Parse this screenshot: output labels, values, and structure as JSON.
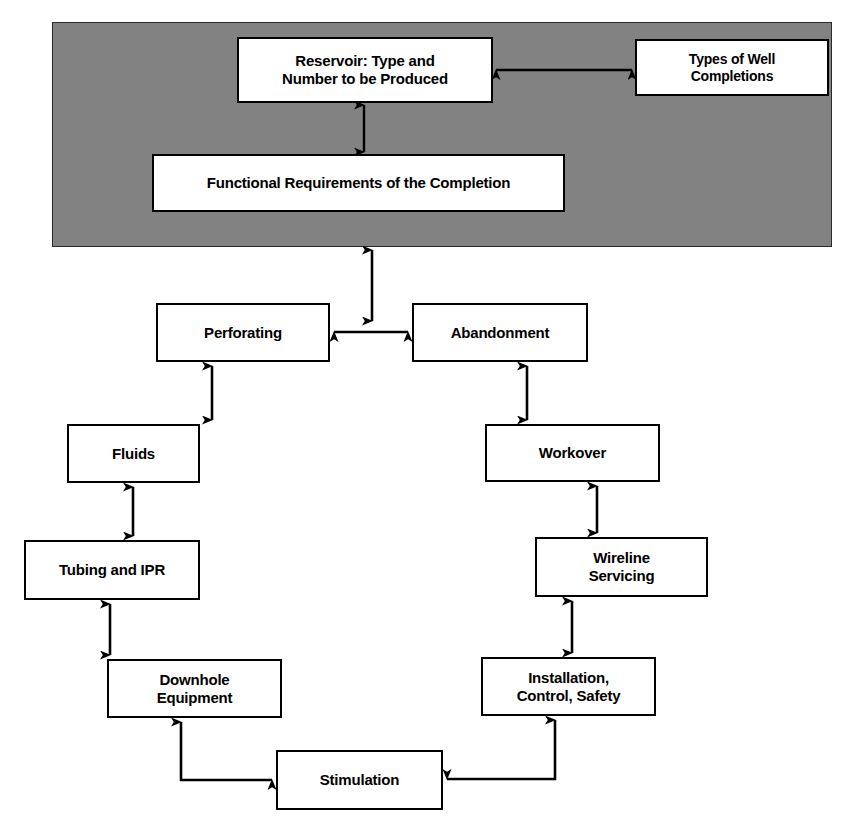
{
  "diagram": {
    "title_present": false,
    "background_color": "#ffffff",
    "panel_color": "#828282",
    "box_fill": "#ffffff",
    "line_color": "#000000",
    "panel": {
      "name": "completion-design-panel",
      "x": 52,
      "y": 22,
      "w": 780,
      "h": 225
    },
    "nodes": [
      {
        "id": "reservoir",
        "label": "Reservoir:  Type and\nNumber to be Produced",
        "x": 238,
        "y": 38,
        "w": 254,
        "h": 64,
        "font_size": 15,
        "in_panel": true
      },
      {
        "id": "well-completions",
        "label": "Types of Well\nCompletions",
        "x": 636,
        "y": 40,
        "w": 192,
        "h": 55,
        "font_size": 14,
        "in_panel": true
      },
      {
        "id": "functional-requirements",
        "label": "Functional Requirements of the Completion",
        "x": 153,
        "y": 155,
        "w": 411,
        "h": 56,
        "font_size": 15,
        "in_panel": true
      },
      {
        "id": "perforating",
        "label": "Perforating",
        "x": 156,
        "y": 303,
        "w": 174,
        "h": 59,
        "font_size": 15,
        "in_panel": false
      },
      {
        "id": "abandonment",
        "label": "Abandonment",
        "x": 412,
        "y": 303,
        "w": 176,
        "h": 59,
        "font_size": 15,
        "in_panel": false
      },
      {
        "id": "fluids",
        "label": "Fluids",
        "x": 67,
        "y": 424,
        "w": 133,
        "h": 59,
        "font_size": 15,
        "in_panel": false
      },
      {
        "id": "workover",
        "label": "Workover",
        "x": 485,
        "y": 424,
        "w": 175,
        "h": 58,
        "font_size": 15,
        "in_panel": false
      },
      {
        "id": "tubing-and-ipr",
        "label": "Tubing and IPR",
        "x": 24,
        "y": 540,
        "w": 176,
        "h": 60,
        "font_size": 15,
        "in_panel": false
      },
      {
        "id": "wireline-servicing",
        "label": "Wireline\nServicing",
        "x": 535,
        "y": 537,
        "w": 173,
        "h": 60,
        "font_size": 15,
        "in_panel": false
      },
      {
        "id": "downhole-equipment",
        "label": "Downhole\nEquipment",
        "x": 107,
        "y": 659,
        "w": 175,
        "h": 59,
        "font_size": 15,
        "in_panel": false
      },
      {
        "id": "installation-control-safety",
        "label": "Installation,\nControl, Safety",
        "x": 481,
        "y": 657,
        "w": 175,
        "h": 59,
        "font_size": 15,
        "in_panel": false
      },
      {
        "id": "stimulation",
        "label": "Stimulation",
        "x": 276,
        "y": 750,
        "w": 167,
        "h": 60,
        "font_size": 15,
        "in_panel": false
      }
    ],
    "connectors": [
      {
        "id": "reservoir-to-well-completions",
        "from": "reservoir",
        "to": "well-completions",
        "kind": "double-arrow",
        "orientation": "horizontal"
      },
      {
        "id": "reservoir-to-functional-requirements",
        "from": "reservoir",
        "to": "functional-requirements",
        "kind": "double-arrow",
        "orientation": "vertical"
      },
      {
        "id": "panel-to-perforating-abandonment",
        "from": "completion-design-panel",
        "to": "perforating",
        "kind": "double-arrow",
        "orientation": "vertical"
      },
      {
        "id": "perforating-to-abandonment",
        "from": "perforating",
        "to": "abandonment",
        "kind": "double-arrow",
        "orientation": "horizontal"
      },
      {
        "id": "perforating-to-fluids",
        "from": "perforating",
        "to": "fluids",
        "kind": "double-arrow",
        "orientation": "vertical"
      },
      {
        "id": "fluids-to-tubing-and-ipr",
        "from": "fluids",
        "to": "tubing-and-ipr",
        "kind": "double-arrow",
        "orientation": "vertical"
      },
      {
        "id": "tubing-and-ipr-to-downhole-equipment",
        "from": "tubing-and-ipr",
        "to": "downhole-equipment",
        "kind": "double-arrow",
        "orientation": "vertical"
      },
      {
        "id": "downhole-equipment-to-stimulation",
        "from": "downhole-equipment",
        "to": "stimulation",
        "kind": "double-arrow",
        "orientation": "elbow"
      },
      {
        "id": "abandonment-to-workover",
        "from": "abandonment",
        "to": "workover",
        "kind": "double-arrow",
        "orientation": "vertical"
      },
      {
        "id": "workover-to-wireline-servicing",
        "from": "workover",
        "to": "wireline-servicing",
        "kind": "double-arrow",
        "orientation": "vertical"
      },
      {
        "id": "wireline-servicing-to-installation",
        "from": "wireline-servicing",
        "to": "installation-control-safety",
        "kind": "double-arrow",
        "orientation": "vertical"
      },
      {
        "id": "installation-to-stimulation",
        "from": "installation-control-safety",
        "to": "stimulation",
        "kind": "double-arrow",
        "orientation": "elbow"
      }
    ]
  }
}
